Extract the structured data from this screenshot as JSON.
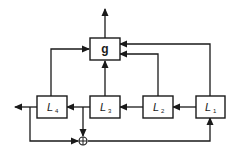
{
  "diagram": {
    "type": "block-diagram",
    "blocks": [
      {
        "id": "g",
        "label": "g",
        "subscript": ""
      },
      {
        "id": "L4",
        "label": "L",
        "subscript": "4"
      },
      {
        "id": "L3",
        "label": "L",
        "subscript": "3"
      },
      {
        "id": "L2",
        "label": "L",
        "subscript": "2"
      },
      {
        "id": "L1",
        "label": "L",
        "subscript": "1"
      }
    ],
    "summing_junction": {
      "symbol": "⊕"
    },
    "connections": [
      {
        "from": "L1",
        "to": "L2"
      },
      {
        "from": "L2",
        "to": "L3"
      },
      {
        "from": "L3",
        "to": "L4"
      },
      {
        "from": "L4",
        "to": "output-left"
      },
      {
        "from": "L1",
        "to": "g"
      },
      {
        "from": "L2",
        "to": "g"
      },
      {
        "from": "L3",
        "to": "g"
      },
      {
        "from": "L4",
        "to": "g"
      },
      {
        "from": "g",
        "to": "output-top"
      },
      {
        "from": "L4-output",
        "to": "sum"
      },
      {
        "from": "L3-output",
        "to": "sum"
      },
      {
        "from": "sum",
        "to": "L1"
      }
    ],
    "colors": {
      "line": "#1a1a1a",
      "background": "#ffffff"
    }
  }
}
